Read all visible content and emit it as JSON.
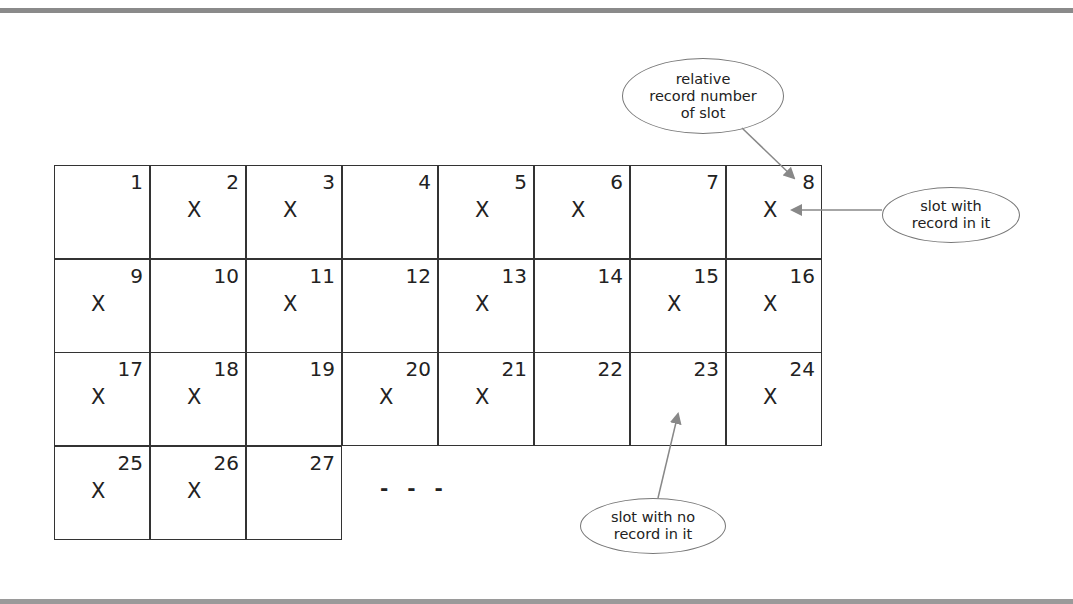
{
  "diagram": {
    "slots": [
      {
        "n": "1",
        "filled": false
      },
      {
        "n": "2",
        "filled": true
      },
      {
        "n": "3",
        "filled": true
      },
      {
        "n": "4",
        "filled": false
      },
      {
        "n": "5",
        "filled": true
      },
      {
        "n": "6",
        "filled": true
      },
      {
        "n": "7",
        "filled": false
      },
      {
        "n": "8",
        "filled": true
      },
      {
        "n": "9",
        "filled": true
      },
      {
        "n": "10",
        "filled": false
      },
      {
        "n": "11",
        "filled": true
      },
      {
        "n": "12",
        "filled": false
      },
      {
        "n": "13",
        "filled": true
      },
      {
        "n": "14",
        "filled": false
      },
      {
        "n": "15",
        "filled": true
      },
      {
        "n": "16",
        "filled": true
      },
      {
        "n": "17",
        "filled": true
      },
      {
        "n": "18",
        "filled": true
      },
      {
        "n": "19",
        "filled": false
      },
      {
        "n": "20",
        "filled": true
      },
      {
        "n": "21",
        "filled": true
      },
      {
        "n": "22",
        "filled": false
      },
      {
        "n": "23",
        "filled": false
      },
      {
        "n": "24",
        "filled": true
      },
      {
        "n": "25",
        "filled": true
      },
      {
        "n": "26",
        "filled": true
      },
      {
        "n": "27",
        "filled": false
      }
    ],
    "record_mark": "X",
    "columns": 8,
    "continuation": "- - -",
    "callouts": {
      "relative_number": "relative\nrecord number\nof slot",
      "slot_with_record": "slot with\nrecord in it",
      "slot_no_record": "slot with no\nrecord in it"
    },
    "colors": {
      "line": "#333333",
      "arrow": "#888888",
      "callout_border": "#777777",
      "rule": "#8a8a8a"
    }
  }
}
